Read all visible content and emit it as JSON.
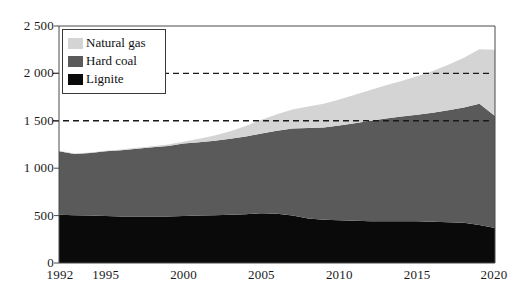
{
  "chart_data": {
    "type": "area",
    "stacked": true,
    "title": "",
    "subtitle": "",
    "xlabel": "",
    "ylabel": "",
    "xlim": [
      1992,
      2020
    ],
    "ylim": [
      0,
      2500
    ],
    "yticks": [
      0,
      500,
      1000,
      1500,
      2000,
      2500
    ],
    "ytick_labels": [
      "0",
      "500",
      "1 000",
      "1 500",
      "2 000",
      "2 500"
    ],
    "xticks": [
      1992,
      1995,
      2000,
      2005,
      2010,
      2015,
      2020
    ],
    "xtick_labels": [
      "1992",
      "1995",
      "2000",
      "2005",
      "2010",
      "2015",
      "2020"
    ],
    "grid": "dashed horizontal gridlines at 1500 and 2000",
    "gridlines": [
      1500,
      2000
    ],
    "legend_position": "upper-left-inside",
    "x": [
      1992,
      1993,
      1994,
      1995,
      1996,
      1997,
      1998,
      1999,
      2000,
      2001,
      2002,
      2003,
      2004,
      2005,
      2006,
      2007,
      2008,
      2009,
      2010,
      2011,
      2012,
      2013,
      2014,
      2015,
      2016,
      2017,
      2018,
      2019,
      2020
    ],
    "series": [
      {
        "name": "Lignite",
        "color": "#0a0a0a",
        "values": [
          510,
          505,
          500,
          495,
          490,
          490,
          490,
          490,
          495,
          500,
          505,
          510,
          515,
          525,
          520,
          500,
          470,
          455,
          450,
          445,
          440,
          440,
          440,
          440,
          435,
          430,
          425,
          400,
          370
        ]
      },
      {
        "name": "Hard coal",
        "color": "#5a5a5a",
        "values": [
          670,
          645,
          660,
          685,
          700,
          715,
          730,
          745,
          765,
          775,
          785,
          800,
          820,
          840,
          875,
          920,
          955,
          975,
          1000,
          1030,
          1060,
          1085,
          1105,
          1125,
          1150,
          1180,
          1215,
          1280,
          1180
        ]
      },
      {
        "name": "Natural gas",
        "color": "#d4d4d4",
        "values": [
          5,
          5,
          5,
          5,
          8,
          10,
          12,
          15,
          20,
          35,
          55,
          80,
          110,
          145,
          175,
          200,
          225,
          250,
          275,
          300,
          325,
          350,
          375,
          405,
          440,
          480,
          525,
          575,
          700
        ]
      }
    ]
  },
  "legend": {
    "items": [
      {
        "label": "Natural gas",
        "color": "#d4d4d4"
      },
      {
        "label": "Hard coal",
        "color": "#5a5a5a"
      },
      {
        "label": "Lignite",
        "color": "#0a0a0a"
      }
    ]
  },
  "axes": {
    "y_labels": [
      "2 500",
      "2 000",
      "1 500",
      "1 000",
      "500",
      "0"
    ],
    "x_labels": [
      "1992",
      "1995",
      "2000",
      "2005",
      "2010",
      "2015",
      "2020"
    ]
  },
  "colors": {
    "natural_gas": "#d4d4d4",
    "hard_coal": "#5a5a5a",
    "lignite": "#0a0a0a",
    "axis": "#4a4a4a",
    "gridline": "#1a1a1a",
    "background": "#ffffff"
  }
}
